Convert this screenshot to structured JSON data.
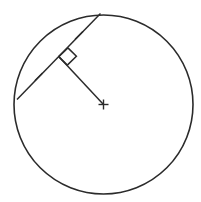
{
  "figure": {
    "background_color": "#ffffff",
    "stroke_color": "#2b2b2b",
    "width": 201,
    "height": 202
  },
  "chart_data": {
    "type": "diagram",
    "subtitle": "",
    "xlabel": "",
    "ylabel": "",
    "grid": false,
    "legend": null,
    "coordinate_space": {
      "width": 201,
      "height": 202,
      "origin": "top-left",
      "units": "px"
    },
    "shapes": [
      {
        "name": "circle",
        "kind": "circle",
        "center": [
          103.5,
          104.5
        ],
        "radius": 89.5,
        "stroke": "#2b2b2b",
        "stroke_width": 1.6,
        "fill": "none"
      },
      {
        "name": "chord",
        "kind": "segment",
        "from": [
          17.0,
          99.5
        ],
        "to": [
          100.5,
          13.5
        ],
        "stroke": "#2b2b2b",
        "stroke_width": 1.5
      },
      {
        "name": "radius-to-chord",
        "kind": "segment",
        "from": [
          103.5,
          104.5
        ],
        "to": [
          58.7,
          56.6
        ],
        "stroke": "#2b2b2b",
        "stroke_width": 1.5
      },
      {
        "name": "right-angle-marker",
        "kind": "polyline",
        "vertex": [
          58.7,
          56.6
        ],
        "points": [
          [
            67.9,
            47.9
          ],
          [
            76.4,
            56.3
          ],
          [
            67.3,
            65.1
          ]
        ],
        "size": 12.5,
        "stroke": "#2b2b2b",
        "stroke_width": 1.5
      },
      {
        "name": "center-cross-mark",
        "kind": "cross",
        "center": [
          103.5,
          104.5
        ],
        "arm_length": 5.0,
        "stroke": "#2b2b2b",
        "stroke_width": 1.4
      }
    ],
    "congruence_marks": [
      {
        "name": "chord-tick-upper",
        "on": "chord",
        "position": [
          79.0,
          35.4
        ],
        "count": 1,
        "length": 11,
        "angle_deg": -45
      },
      {
        "name": "chord-tick-lower",
        "on": "chord",
        "position": [
          38.7,
          76.9
        ],
        "count": 1,
        "length": 11,
        "angle_deg": -45
      }
    ],
    "annotations": [],
    "labels": [],
    "relationships": [
      "The radius drawn from the center meets the chord at a right angle.",
      "The two tick marks indicate the chord's two halves are congruent."
    ]
  }
}
